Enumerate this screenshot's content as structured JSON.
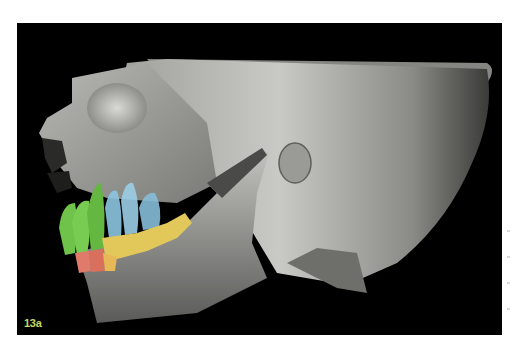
{
  "figure": {
    "label": "13a",
    "label_color": "#c8d860",
    "background_color": "#000000",
    "tooth_colors": {
      "incisors_canines_upper": "#6fc24a",
      "premolars_upper": "#8cc4e0",
      "molars": "#e2c85a",
      "incisors_lower": "#e07a6a"
    }
  }
}
